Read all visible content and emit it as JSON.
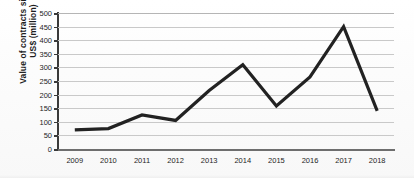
{
  "chart_data": {
    "type": "line",
    "title": "",
    "subtitle": "",
    "xlabel": "",
    "ylabel": "Value of contracts signed US$ (million)",
    "ylabel_line1": "Value of contracts signed",
    "ylabel_line2": "US$ (million)",
    "categories": [
      "2009",
      "2010",
      "2011",
      "2012",
      "2013",
      "2014",
      "2015",
      "2016",
      "2017",
      "2018"
    ],
    "values": [
      70,
      75,
      125,
      105,
      215,
      310,
      158,
      265,
      450,
      140
    ],
    "series": [
      {
        "name": "Value of contracts signed",
        "values": [
          70,
          75,
          125,
          105,
          215,
          310,
          158,
          265,
          450,
          140
        ]
      }
    ],
    "ylim": [
      0,
      500
    ],
    "ytick_values": [
      0,
      50,
      100,
      150,
      200,
      250,
      300,
      350,
      400,
      450,
      500
    ],
    "ytick_labels": [
      "0",
      "50",
      "100",
      "150",
      "200",
      "250",
      "300",
      "350",
      "400",
      "450",
      "500"
    ],
    "xtick_labels": [
      "2009",
      "2010",
      "2011",
      "2012",
      "2013",
      "2014",
      "2015",
      "2016",
      "2017",
      "2018"
    ],
    "grid": "horizontal",
    "legend": "none",
    "markers": "none",
    "line_color": "#222222",
    "grid_color": "#c9c9c9",
    "axis_color": "#3a3a3a",
    "background_color": "#fdfdfd"
  }
}
